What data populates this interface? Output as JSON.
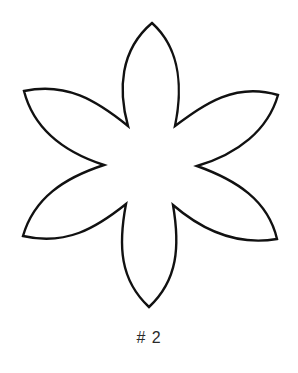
{
  "figure": {
    "shape": "six-petal-flower-outline",
    "stroke_color": "#111111",
    "fill_color": "#ffffff",
    "background": "#ffffff"
  },
  "caption": {
    "label": "# 2"
  }
}
